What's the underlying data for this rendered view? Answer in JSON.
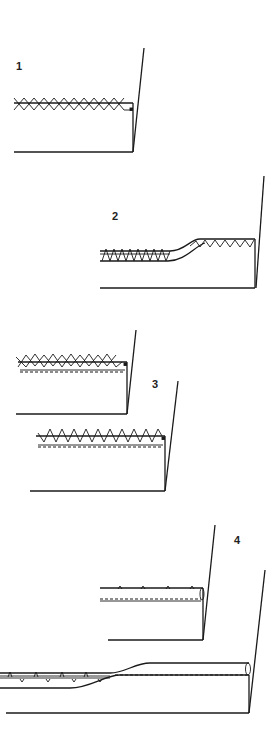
{
  "figure": {
    "colors": {
      "ink": "#1a1a1a",
      "background": "#ffffff"
    },
    "panels": [
      {
        "id": "1",
        "label": "1",
        "description": "Catch-stitch (cross stitch) over raw hem edge"
      },
      {
        "id": "2",
        "label": "2",
        "description": "Overcast/zig-zag stitch hem with tapered fold"
      },
      {
        "id": "3",
        "label": "3",
        "description": "Cross stitch and blind hem stitch over machine-stitched folded edge"
      },
      {
        "id": "4",
        "label": "4",
        "description": "Slip-stitched rolled hem with tapered turn"
      }
    ]
  }
}
